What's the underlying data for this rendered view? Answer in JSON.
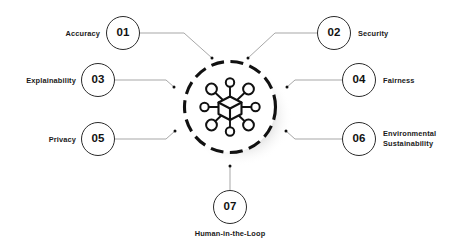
{
  "diagram": {
    "type": "radial-hub",
    "background_color": "#ffffff",
    "accent_color": "#111111",
    "line_color": "#9a9a9a",
    "hub": {
      "icon_name": "network-cube-icon",
      "ring_style": "dashed",
      "ring_color": "#111111",
      "node_count": 8
    },
    "nodes": [
      {
        "id": "01",
        "number": "01",
        "label": "Accuracy",
        "side": "left",
        "position": "top-left"
      },
      {
        "id": "02",
        "number": "02",
        "label": "Security",
        "side": "right",
        "position": "top-right"
      },
      {
        "id": "03",
        "number": "03",
        "label": "Explainability",
        "side": "left",
        "position": "middle-left"
      },
      {
        "id": "04",
        "number": "04",
        "label": "Fairness",
        "side": "right",
        "position": "middle-right"
      },
      {
        "id": "05",
        "number": "05",
        "label": "Privacy",
        "side": "left",
        "position": "bottom-left"
      },
      {
        "id": "06",
        "number": "06",
        "label": "Environmental\nSustainability",
        "side": "right",
        "position": "bottom-right"
      },
      {
        "id": "07",
        "number": "07",
        "label": "Human-in-the-Loop",
        "side": "center",
        "position": "bottom-center"
      }
    ]
  }
}
